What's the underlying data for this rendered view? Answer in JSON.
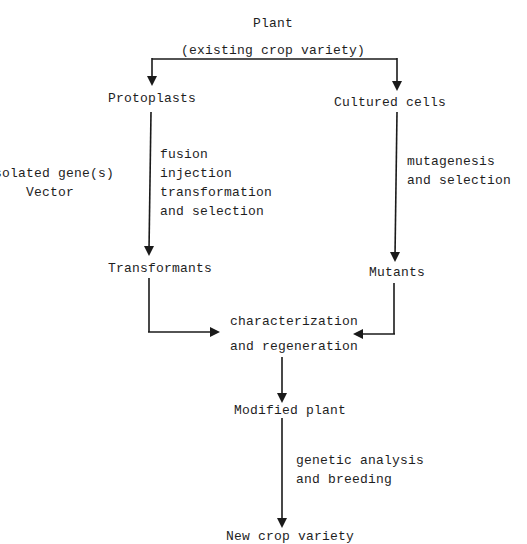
{
  "diagram": {
    "title": "Plant",
    "subtitle": "(existing crop variety)",
    "nodes": {
      "protoplasts": "Protoplasts",
      "cultured_cells": "Cultured cells",
      "transformants": "Transformants",
      "mutants": "Mutants",
      "characterization_1": "characterization",
      "characterization_2": "and regeneration",
      "modified_plant": "Modified plant",
      "new_crop_variety": "New crop variety"
    },
    "side_inputs": {
      "line1": "Isolated gene(s)",
      "line2": "Vector"
    },
    "edge_labels": {
      "left_branch": [
        "fusion",
        "injection",
        "transformation",
        "and selection"
      ],
      "right_branch": [
        "mutagenesis",
        "and selection"
      ],
      "bottom": [
        "genetic analysis",
        "and breeding"
      ]
    }
  }
}
